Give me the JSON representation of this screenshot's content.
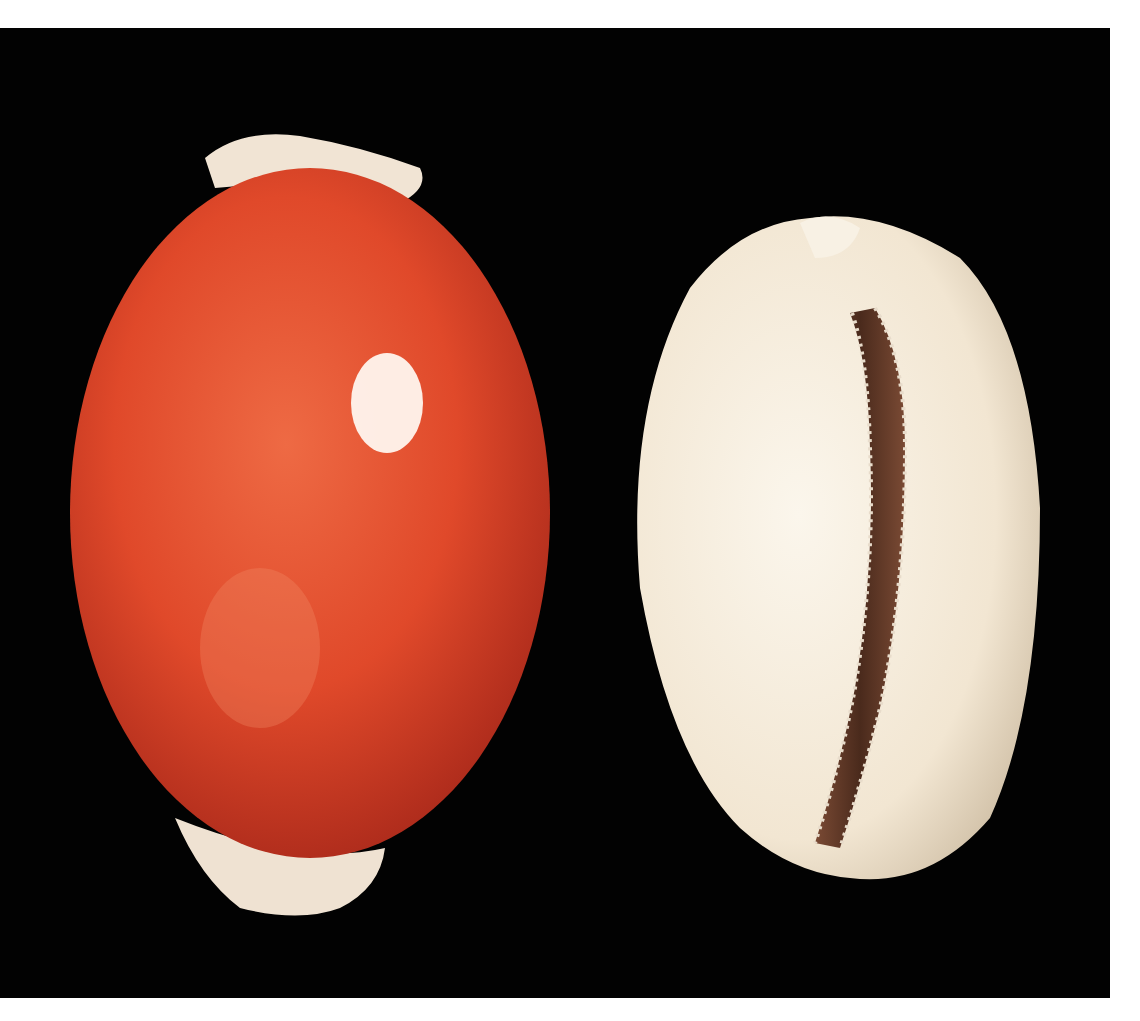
{
  "image": {
    "subject": "Two cowrie shells on a black background",
    "shells": [
      {
        "label": "dorsal-view",
        "description": "Large orange-red glossy cowrie shell, dorsal side"
      },
      {
        "label": "ventral-view",
        "description": "Pale cream cowrie shell, ventral side with toothed aperture"
      }
    ],
    "colors": {
      "background": "#020202",
      "border": "#ffffff",
      "shell_dorsal": "#e24a2a",
      "shell_dorsal_edge": "#f2e6d8",
      "shell_ventral": "#f7eee0",
      "aperture": "#5e3a2a"
    }
  }
}
